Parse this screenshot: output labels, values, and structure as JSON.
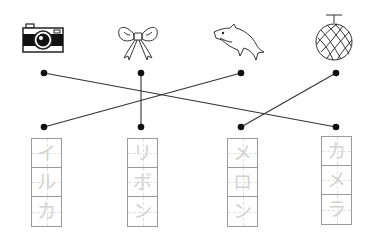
{
  "worksheet": {
    "pictures": [
      {
        "name": "camera",
        "icon": "camera-icon"
      },
      {
        "name": "ribbon",
        "icon": "ribbon-bow-icon"
      },
      {
        "name": "dolphin",
        "icon": "dolphin-icon"
      },
      {
        "name": "melon",
        "icon": "melon-icon"
      }
    ],
    "words": [
      {
        "chars": [
          "イ",
          "ル",
          "カ"
        ],
        "reading": "iruka"
      },
      {
        "chars": [
          "リ",
          "ボ",
          "ン"
        ],
        "reading": "ribon"
      },
      {
        "chars": [
          "メ",
          "ロ",
          "ン"
        ],
        "reading": "meron"
      },
      {
        "chars": [
          "カ",
          "メ",
          "ラ"
        ],
        "reading": "kamera"
      }
    ],
    "connections": [
      {
        "from_picture": "camera",
        "to_word": "カメラ"
      },
      {
        "from_picture": "ribbon",
        "to_word": "リボン"
      },
      {
        "from_picture": "dolphin",
        "to_word": "イルカ"
      },
      {
        "from_picture": "melon",
        "to_word": "メロン"
      }
    ],
    "colors": {
      "line": "#333333",
      "dot": "#111111",
      "trace_text": "#d3d3d3",
      "box_border": "#9a9a9a"
    }
  }
}
